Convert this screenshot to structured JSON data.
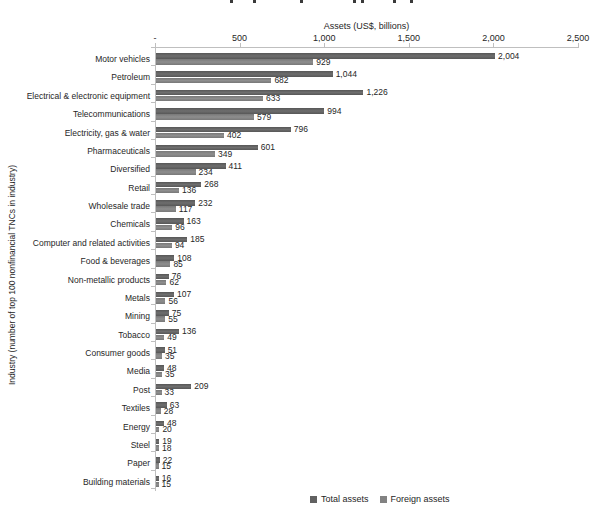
{
  "figure": {
    "axis_title": "Assets (US$, billions)",
    "y_axis_label": "Industry (number of top 100 nonfinancial TNCs in industry)",
    "x_ticks": [
      "-",
      "500",
      "1,000",
      "1,500",
      "2,000",
      "2,500"
    ],
    "x_tick_values": [
      0,
      500,
      1000,
      1500,
      2000,
      2500
    ]
  },
  "chart_data": {
    "type": "bar",
    "orientation": "horizontal",
    "xlabel": "Assets (US$, billions)",
    "ylabel": "Industry (number of top 100 nonfinancial TNCs in industry)",
    "xlim": [
      0,
      2500
    ],
    "grid": false,
    "value_labels": true,
    "legend_position": "bottom",
    "categories": [
      "Motor vehicles",
      "Petroleum",
      "Electrical & electronic equipment",
      "Telecommunications",
      "Electricity, gas & water",
      "Pharmaceuticals",
      "Diversified",
      "Retail",
      "Wholesale trade",
      "Chemicals",
      "Computer and related activities",
      "Food & beverages",
      "Non-metallic products",
      "Metals",
      "Mining",
      "Tobacco",
      "Consumer goods",
      "Media",
      "Post",
      "Textiles",
      "Energy",
      "Steel",
      "Paper",
      "Building materials"
    ],
    "series": [
      {
        "name": "Total assets",
        "color": "#616161",
        "values": [
          2004,
          1044,
          1226,
          994,
          796,
          601,
          411,
          268,
          232,
          163,
          185,
          108,
          76,
          107,
          75,
          136,
          51,
          48,
          209,
          63,
          48,
          19,
          22,
          16
        ]
      },
      {
        "name": "Foreign assets",
        "color": "#828282",
        "values": [
          929,
          682,
          633,
          579,
          402,
          349,
          234,
          136,
          117,
          96,
          94,
          85,
          62,
          56,
          55,
          49,
          35,
          35,
          33,
          28,
          20,
          18,
          15,
          15
        ]
      }
    ]
  },
  "cropped_title_fragment_xs": [
    230,
    253,
    300,
    353,
    361,
    393,
    410
  ]
}
